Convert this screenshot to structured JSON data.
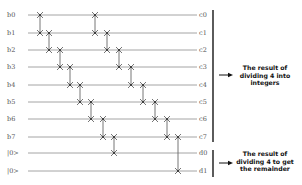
{
  "diagram": {
    "wires": [
      {
        "left_label": "b0",
        "right_label": "c0",
        "y": 15
      },
      {
        "left_label": "b1",
        "right_label": "c1",
        "y": 33
      },
      {
        "left_label": "b2",
        "right_label": "c2",
        "y": 50
      },
      {
        "left_label": "b3",
        "right_label": "c3",
        "y": 67
      },
      {
        "left_label": "b4",
        "right_label": "c4",
        "y": 85
      },
      {
        "left_label": "b5",
        "right_label": "c5",
        "y": 102
      },
      {
        "left_label": "b6",
        "right_label": "c6",
        "y": 119
      },
      {
        "left_label": "b7",
        "right_label": "c7",
        "y": 137
      },
      {
        "left_label": "|0>",
        "right_label": "d0",
        "y": 153
      },
      {
        "left_label": "|0>",
        "right_label": "d1",
        "y": 171
      }
    ],
    "wire_start_x": 28,
    "wire_end_x": 197,
    "swap_gates": [
      {
        "x": 40,
        "from": 0,
        "to": 1
      },
      {
        "x": 49,
        "from": 1,
        "to": 2
      },
      {
        "x": 60,
        "from": 2,
        "to": 3
      },
      {
        "x": 70,
        "from": 3,
        "to": 4
      },
      {
        "x": 80,
        "from": 4,
        "to": 5
      },
      {
        "x": 91,
        "from": 5,
        "to": 6
      },
      {
        "x": 103,
        "from": 6,
        "to": 7
      },
      {
        "x": 114,
        "from": 7,
        "to": 8
      },
      {
        "x": 95,
        "from": 0,
        "to": 1
      },
      {
        "x": 107,
        "from": 1,
        "to": 2
      },
      {
        "x": 119,
        "from": 2,
        "to": 3
      },
      {
        "x": 131,
        "from": 3,
        "to": 4
      },
      {
        "x": 143,
        "from": 4,
        "to": 5
      },
      {
        "x": 155,
        "from": 5,
        "to": 6
      },
      {
        "x": 167,
        "from": 6,
        "to": 7
      },
      {
        "x": 178,
        "from": 7,
        "to": 9
      }
    ],
    "brackets": [
      {
        "x": 213,
        "y1": 10,
        "y2": 142
      },
      {
        "x": 213,
        "y1": 150,
        "y2": 177
      }
    ],
    "annotations": [
      {
        "lines": [
          "The result of",
          "dividing 4 into",
          "integers"
        ],
        "arrow_y": 75,
        "text_top": 64
      },
      {
        "lines": [
          "The result of",
          "dividing 4 to get",
          "the remainder"
        ],
        "arrow_y": 163,
        "text_top": 150
      }
    ],
    "colors": {
      "wire": "#9a9a9a",
      "gate": "#666666",
      "bracket": "#333333",
      "arrow": "#111111",
      "label": "#555555"
    }
  }
}
